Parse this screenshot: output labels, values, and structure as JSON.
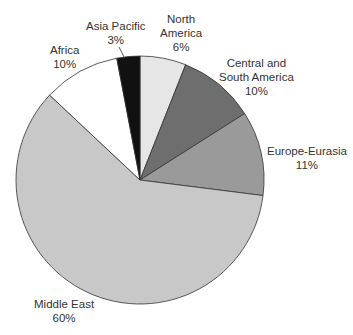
{
  "chart_data": {
    "type": "pie",
    "title": "",
    "categories": [
      "North America",
      "Central and South America",
      "Europe-Eurasia",
      "Middle East",
      "Africa",
      "Asia Pacific"
    ],
    "values": [
      6,
      10,
      11,
      60,
      10,
      3
    ],
    "unit": "%",
    "start_angle": "12 o'clock, clockwise",
    "colors": [
      "#e6e6e6",
      "#6e6e6e",
      "#9a9a9a",
      "#c8c8c8",
      "#ffffff",
      "#111111"
    ],
    "legend": "none (direct labels)"
  },
  "labels": [
    {
      "name": "North\nAmerica",
      "line1": "North",
      "line2": "America",
      "line3": "6%"
    },
    {
      "line1": "Central and",
      "line2": "South America",
      "line3": "10%"
    },
    {
      "line1": "Europe-Eurasia",
      "line2": "11%"
    },
    {
      "line1": "Middle East",
      "line2": "60%"
    },
    {
      "line1": "Africa",
      "line2": "10%"
    },
    {
      "line1": "Asia Pacific",
      "line2": "3%"
    }
  ]
}
